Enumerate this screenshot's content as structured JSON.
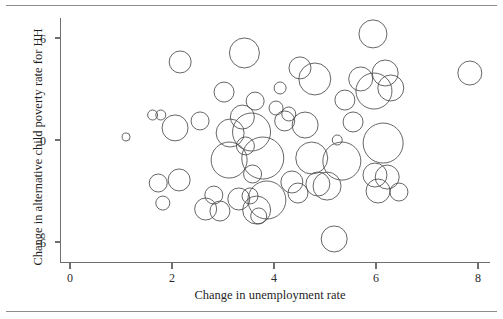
{
  "figure": {
    "top_rule": "",
    "bottom_rule": ""
  },
  "chart_data": {
    "type": "scatter",
    "title": "",
    "subtitle": "",
    "xlabel": "Change in unemployment rate",
    "ylabel": "Change in alternative child poverty rate for HH",
    "xlim": [
      -0.35,
      8.5
    ],
    "ylim": [
      -7.6,
      7.4
    ],
    "xticks": [
      0,
      2,
      4,
      6,
      8
    ],
    "xtick_labels": [
      "0",
      "2",
      "4",
      "6",
      "8"
    ],
    "yticks": [
      6,
      0,
      -6
    ],
    "ytick_labels": [
      "6",
      "0",
      "-6"
    ],
    "grid": false,
    "legend": "none",
    "marker": "open-circle",
    "size_encoding": "bubble area proportional to weight",
    "points": [
      {
        "x": 1.1,
        "y": 0.18,
        "r": 4
      },
      {
        "x": 1.62,
        "y": 1.47,
        "r": 5
      },
      {
        "x": 1.73,
        "y": -2.53,
        "r": 9
      },
      {
        "x": 1.78,
        "y": 1.47,
        "r": 5
      },
      {
        "x": 1.82,
        "y": -3.71,
        "r": 7
      },
      {
        "x": 2.16,
        "y": 4.59,
        "r": 11
      },
      {
        "x": 2.06,
        "y": 0.71,
        "r": 13
      },
      {
        "x": 2.14,
        "y": -2.35,
        "r": 11
      },
      {
        "x": 2.55,
        "y": 1.12,
        "r": 9
      },
      {
        "x": 2.66,
        "y": -4.06,
        "r": 11
      },
      {
        "x": 2.82,
        "y": -3.24,
        "r": 9
      },
      {
        "x": 2.94,
        "y": -4.18,
        "r": 10
      },
      {
        "x": 3.02,
        "y": 2.82,
        "r": 10
      },
      {
        "x": 3.12,
        "y": -1.18,
        "r": 18
      },
      {
        "x": 3.14,
        "y": 0.41,
        "r": 14
      },
      {
        "x": 3.31,
        "y": -3.47,
        "r": 11
      },
      {
        "x": 3.38,
        "y": 1.35,
        "r": 12
      },
      {
        "x": 3.42,
        "y": 5.12,
        "r": 15
      },
      {
        "x": 3.44,
        "y": -0.35,
        "r": 9
      },
      {
        "x": 3.53,
        "y": -3.29,
        "r": 8
      },
      {
        "x": 3.56,
        "y": 0.47,
        "r": 19
      },
      {
        "x": 3.58,
        "y": -2.0,
        "r": 9
      },
      {
        "x": 3.63,
        "y": 2.29,
        "r": 9
      },
      {
        "x": 3.66,
        "y": -4.12,
        "r": 14
      },
      {
        "x": 3.7,
        "y": -4.47,
        "r": 8
      },
      {
        "x": 3.78,
        "y": -1.06,
        "r": 21
      },
      {
        "x": 3.86,
        "y": -3.53,
        "r": 19
      },
      {
        "x": 4.04,
        "y": 1.88,
        "r": 7
      },
      {
        "x": 4.12,
        "y": 3.06,
        "r": 6
      },
      {
        "x": 4.21,
        "y": 1.12,
        "r": 10
      },
      {
        "x": 4.29,
        "y": 1.53,
        "r": 7
      },
      {
        "x": 4.35,
        "y": -2.47,
        "r": 11
      },
      {
        "x": 4.47,
        "y": -3.12,
        "r": 10
      },
      {
        "x": 4.51,
        "y": 4.24,
        "r": 11
      },
      {
        "x": 4.61,
        "y": 0.88,
        "r": 13
      },
      {
        "x": 4.74,
        "y": -1.06,
        "r": 16
      },
      {
        "x": 4.8,
        "y": 3.59,
        "r": 16
      },
      {
        "x": 4.86,
        "y": -2.59,
        "r": 12
      },
      {
        "x": 5.04,
        "y": -2.71,
        "r": 14
      },
      {
        "x": 5.18,
        "y": -5.82,
        "r": 13
      },
      {
        "x": 5.24,
        "y": 0.0,
        "r": 5
      },
      {
        "x": 5.33,
        "y": -1.24,
        "r": 19
      },
      {
        "x": 5.39,
        "y": 2.35,
        "r": 10
      },
      {
        "x": 5.55,
        "y": 1.06,
        "r": 10
      },
      {
        "x": 5.7,
        "y": 3.59,
        "r": 12
      },
      {
        "x": 5.94,
        "y": 6.24,
        "r": 14
      },
      {
        "x": 5.96,
        "y": 2.88,
        "r": 18
      },
      {
        "x": 5.98,
        "y": -2.06,
        "r": 12
      },
      {
        "x": 6.04,
        "y": -3.0,
        "r": 12
      },
      {
        "x": 6.14,
        "y": -0.18,
        "r": 20
      },
      {
        "x": 6.18,
        "y": 3.94,
        "r": 13
      },
      {
        "x": 6.22,
        "y": -2.18,
        "r": 12
      },
      {
        "x": 6.29,
        "y": 3.06,
        "r": 13
      },
      {
        "x": 6.45,
        "y": -3.06,
        "r": 9
      },
      {
        "x": 7.84,
        "y": 3.94,
        "r": 12
      }
    ]
  }
}
